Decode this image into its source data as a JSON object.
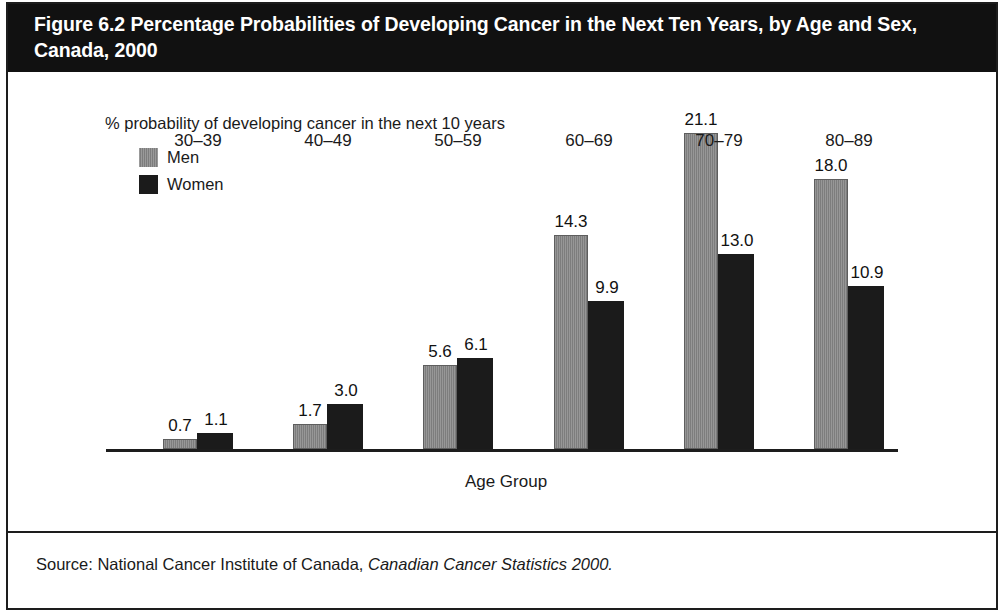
{
  "figure": {
    "title": "Figure 6.2 Percentage Probabilities of Developing Cancer in the Next Ten Years, by Age and Sex, Canada, 2000",
    "source_prefix": "Source: National Cancer Institute of Canada, ",
    "source_italic": "Canadian Cancer Statistics 2000.",
    "colors": {
      "header_background": "#111111",
      "header_text": "#ffffff",
      "men_bar": "#7d7d7d",
      "women_bar": "#1b1b1b",
      "axis": "#1d1d1d",
      "page_background": "#ffffff"
    }
  },
  "chart_data": {
    "type": "bar",
    "title": "Figure 6.2 Percentage Probabilities of Developing Cancer in the Next Ten Years, by Age and Sex, Canada, 2000",
    "subtitle": "% probability of developing cancer in the next 10 years",
    "xlabel": "Age Group",
    "ylabel": "% probability of developing cancer in the next 10 years",
    "categories": [
      "30–39",
      "40–49",
      "50–59",
      "60–69",
      "70–79",
      "80–89"
    ],
    "series": [
      {
        "name": "Men",
        "color": "#7d7d7d",
        "values": [
          0.7,
          1.7,
          5.6,
          14.3,
          21.1,
          18.0
        ]
      },
      {
        "name": "Women",
        "color": "#1b1b1b",
        "values": [
          1.1,
          3.0,
          6.1,
          9.9,
          13.0,
          10.9
        ]
      }
    ],
    "value_labels": {
      "men": [
        "0.7",
        "1.7",
        "5.6",
        "14.3",
        "21.1",
        "18.0"
      ],
      "women": [
        "1.1",
        "3.0",
        "6.1",
        "9.9",
        "13.0",
        "10.9"
      ]
    },
    "ylim": [
      0,
      22
    ],
    "grid": false,
    "legend_position": "top-left",
    "legend_entries": [
      "Men",
      "Women"
    ],
    "data_labels_shown": true,
    "axis_ticks_shown": false
  }
}
